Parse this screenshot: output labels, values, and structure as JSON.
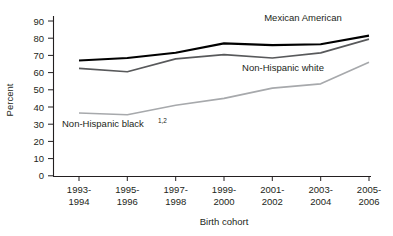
{
  "chart_data": {
    "type": "line",
    "title": "",
    "xlabel": "Birth cohort",
    "ylabel": "Percent",
    "ylim": [
      0,
      90
    ],
    "yticks": [
      "0",
      "10",
      "20",
      "30",
      "40",
      "50",
      "60",
      "70",
      "80",
      "90"
    ],
    "grid": false,
    "legend_position": "inline-annotations",
    "categories": [
      "1993-\n1994",
      "1995-\n1996",
      "1997-\n1998",
      "1999-\n2000",
      "2001-\n2002",
      "2003-\n2004",
      "2005-\n2006"
    ],
    "categories_line1": [
      "1993-",
      "1995-",
      "1997-",
      "1999-",
      "2001-",
      "2003-",
      "2005-"
    ],
    "categories_line2": [
      "1994",
      "1996",
      "1998",
      "2000",
      "2002",
      "2004",
      "2006"
    ],
    "series": [
      {
        "name": "Mexican American",
        "label": "Mexican American",
        "label_superscript": "",
        "color": "#000000",
        "stroke_width": 2.1,
        "values": [
          67,
          68.5,
          71.5,
          77,
          76,
          76.5,
          81.5
        ]
      },
      {
        "name": "Non-Hispanic white",
        "label": "Non-Hispanic white",
        "label_superscript": "",
        "color": "#58595b",
        "stroke_width": 1.7,
        "values": [
          62.5,
          60.5,
          68,
          70.5,
          68.5,
          71.5,
          79.5
        ]
      },
      {
        "name": "Non-Hispanic black",
        "label": "Non-Hispanic black",
        "label_superscript": "1,2",
        "color": "#a7a9ac",
        "stroke_width": 1.7,
        "values": [
          36.5,
          35.5,
          41,
          45,
          51,
          53.5,
          66
        ]
      }
    ],
    "annotations": [
      {
        "text": "Mexican American",
        "superscript": "",
        "x": 303,
        "y": 21
      },
      {
        "text": "Non-Hispanic white",
        "superscript": "",
        "x": 283,
        "y": 71
      },
      {
        "text": "Non-Hispanic black",
        "superscript": "1,2",
        "x": 118,
        "y": 127
      }
    ]
  }
}
